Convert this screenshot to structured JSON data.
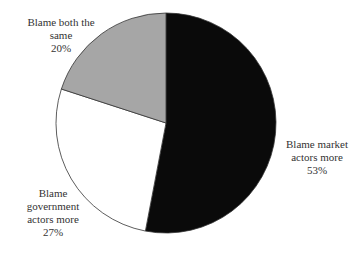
{
  "chart_data": {
    "type": "pie",
    "title": "",
    "start_angle_deg": 0,
    "direction": "clockwise",
    "slices": [
      {
        "label": "Blame market actors more",
        "value": 53,
        "display": "53%",
        "color": "#0a0a0a"
      },
      {
        "label": "Blame government actors more",
        "value": 27,
        "display": "27%",
        "color": "#ffffff"
      },
      {
        "label": "Blame both the same",
        "value": 20,
        "display": "20%",
        "color": "#a6a6a6"
      }
    ]
  },
  "labels": {
    "market": {
      "line1": "Blame market",
      "line2": "actors more",
      "pct": "53%"
    },
    "government": {
      "line1": "Blame",
      "line2": "government",
      "line3": "actors more",
      "pct": "27%"
    },
    "both": {
      "line1": "Blame both the",
      "line2": "same",
      "pct": "20%"
    }
  }
}
